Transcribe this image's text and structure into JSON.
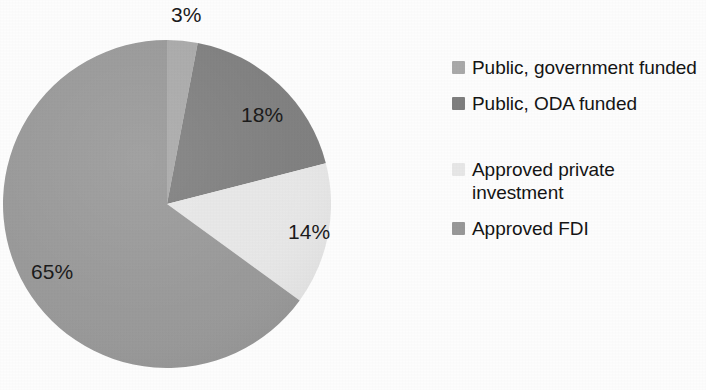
{
  "chart_data": {
    "type": "pie",
    "title": "",
    "subtitle": "",
    "xlabel": "",
    "ylabel": "",
    "legend_position": "right",
    "grid": false,
    "units": "percent",
    "start_angle_deg": 0,
    "direction": "clockwise",
    "categories": [
      "Public, government funded",
      "Public, ODA funded",
      "Approved private investment",
      "Approved FDI"
    ],
    "values": [
      3,
      18,
      14,
      65
    ],
    "data_labels": [
      "3%",
      "18%",
      "14%",
      "65%"
    ],
    "colors": [
      "#a9a9a9",
      "#7e7e7e",
      "#e7e7e7",
      "#989898"
    ],
    "slices": [
      {
        "label": "Public, government funded",
        "value": 3,
        "display": "3%",
        "color": "#a9a9a9",
        "start_deg": 0,
        "end_deg": 10.8
      },
      {
        "label": "Public, ODA funded",
        "value": 18,
        "display": "18%",
        "color": "#7e7e7e",
        "start_deg": 10.8,
        "end_deg": 75.6
      },
      {
        "label": "Approved private investment",
        "value": 14,
        "display": "14%",
        "color": "#e7e7e7",
        "start_deg": 75.6,
        "end_deg": 126.0
      },
      {
        "label": "Approved FDI",
        "value": 65,
        "display": "65%",
        "color": "#989898",
        "start_deg": 126.0,
        "end_deg": 360.0
      }
    ]
  },
  "pie": {
    "labels": {
      "slice_3": "3%",
      "slice_18": "18%",
      "slice_14": "14%",
      "slice_65": "65%"
    }
  },
  "legend": {
    "items": [
      {
        "label": "Public, government funded",
        "color": "#a9a9a9",
        "swatch_icon": "legend-swatch-icon"
      },
      {
        "label": "Public, ODA funded",
        "color": "#7e7e7e",
        "swatch_icon": "legend-swatch-icon"
      },
      {
        "label": "Approved private investment",
        "color": "#e7e7e7",
        "swatch_icon": "legend-swatch-icon"
      },
      {
        "label": "Approved FDI",
        "color": "#989898",
        "swatch_icon": "legend-swatch-icon"
      }
    ]
  }
}
